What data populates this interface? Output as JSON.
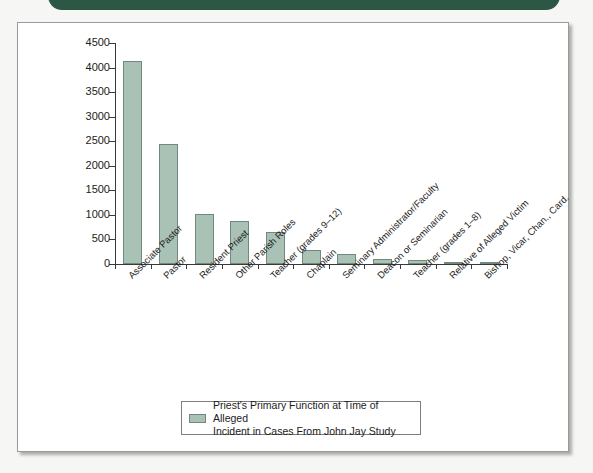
{
  "banner": {
    "color": "#2b5744"
  },
  "figure": {
    "background": "#ffffff",
    "border_color": "#9a9a9a"
  },
  "chart_data": {
    "type": "bar",
    "title": "",
    "subtitle": "",
    "xlabel": "",
    "ylabel": "",
    "ylim": [
      0,
      4500
    ],
    "ytick_labels": [
      "4500",
      "4000",
      "3500",
      "3000",
      "2500",
      "2000",
      "1500",
      "1000",
      "500",
      "0"
    ],
    "ytick_values": [
      4500,
      4000,
      3500,
      3000,
      2500,
      2000,
      1500,
      1000,
      500,
      0
    ],
    "grid": false,
    "legend_position": "bottom-center",
    "bar_color": "#a9c2b5",
    "bar_edge_color": "#6f8a7d",
    "categories": [
      "Associate Pastor",
      "Pastor",
      "Resident Priest",
      "Other Parish Roles",
      "Teacher (grades 9–12)",
      "Chaplain",
      "Seminary Administrator/Faculty",
      "Deacon or Seminarian",
      "Teacher (grades 1–8)",
      "Relative of Alleged Victim",
      "Bishop, Vicar, Chan., Card."
    ],
    "values": [
      4142,
      2449,
      1010,
      870,
      661,
      281,
      201,
      92,
      79,
      50,
      38
    ],
    "legend": [
      {
        "label_line_1": "Priest's Primary Function at Time of Alleged",
        "label_line_2": "Incident in Cases From John Jay Study",
        "color": "#a9c2b5"
      }
    ]
  }
}
